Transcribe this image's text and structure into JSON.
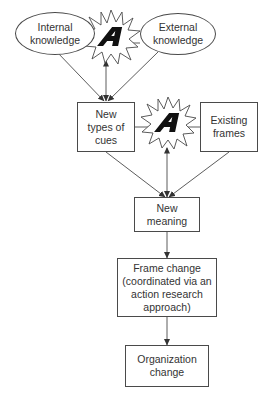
{
  "diagram": {
    "nodes": {
      "internal_knowledge": {
        "label": "Internal\nknowledge",
        "shape": "ellipse"
      },
      "external_knowledge": {
        "label": "External\nknowledge",
        "shape": "ellipse"
      },
      "new_types_of_cues": {
        "label": "New\ntypes of\ncues",
        "shape": "box"
      },
      "existing_frames": {
        "label": "Existing\nframes",
        "shape": "box"
      },
      "new_meaning": {
        "label": "New\nmeaning",
        "shape": "box"
      },
      "frame_change": {
        "label": "Frame change\n(coordinated via an\naction research\napproach)",
        "shape": "box"
      },
      "organization_change": {
        "label": "Organization\nchange",
        "shape": "box"
      }
    },
    "starbursts": [
      {
        "glyph": "A",
        "between": [
          "internal_knowledge",
          "external_knowledge"
        ]
      },
      {
        "glyph": "A",
        "between": [
          "new_types_of_cues",
          "existing_frames"
        ]
      }
    ],
    "edges": [
      {
        "from": "internal_knowledge",
        "to": "new_types_of_cues",
        "arrow": "end"
      },
      {
        "from": "external_knowledge",
        "to": "new_types_of_cues",
        "arrow": "end"
      },
      {
        "from": "starburst_1",
        "to": "new_types_of_cues",
        "arrow": "both"
      },
      {
        "from": "new_types_of_cues",
        "to": "new_meaning",
        "arrow": "end"
      },
      {
        "from": "existing_frames",
        "to": "new_meaning",
        "arrow": "end"
      },
      {
        "from": "starburst_2",
        "to": "new_meaning",
        "arrow": "both"
      },
      {
        "from": "new_meaning",
        "to": "frame_change",
        "arrow": "end"
      },
      {
        "from": "frame_change",
        "to": "organization_change",
        "arrow": "end"
      }
    ],
    "colors": {
      "line": "#4a4a4a",
      "text": "#333333",
      "glyph": "#111111",
      "background": "#ffffff"
    }
  }
}
